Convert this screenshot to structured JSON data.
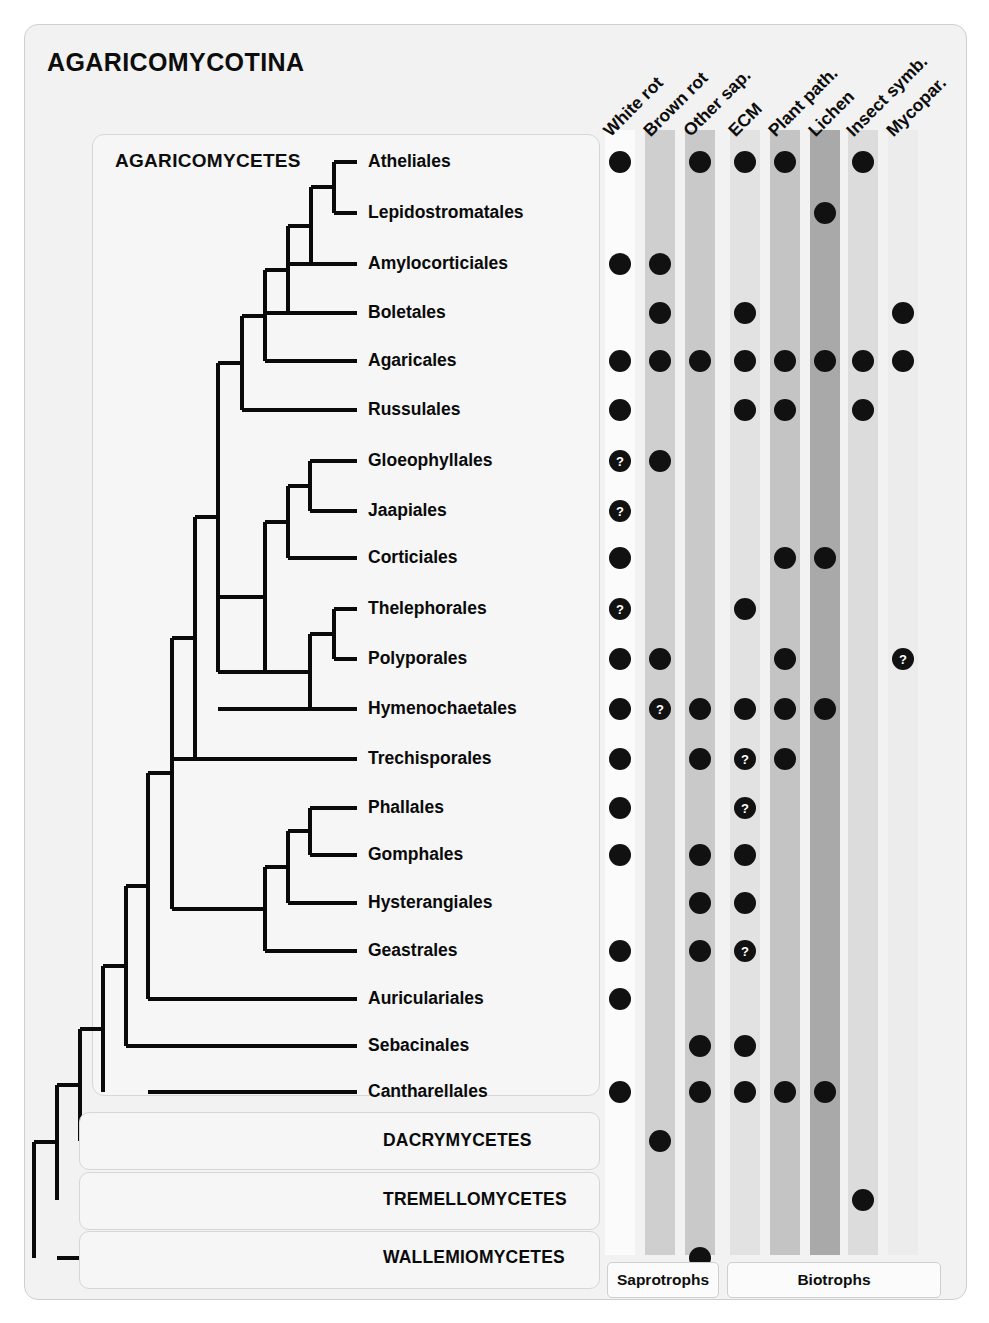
{
  "figure": {
    "title": "AGARICOMYCOTINA",
    "clade_title": "AGARICOMYCETES"
  },
  "columns": [
    {
      "key": "white_rot",
      "label": "White rot",
      "x": 620,
      "shade": "#fbfbfb",
      "group": "saprotrophs"
    },
    {
      "key": "brown_rot",
      "label": "Brown rot",
      "x": 660,
      "shade": "#cfcfcf",
      "group": "saprotrophs"
    },
    {
      "key": "other_sap",
      "label": "Other sap.",
      "x": 700,
      "shade": "#c9c9c9",
      "group": "saprotrophs"
    },
    {
      "key": "ecm",
      "label": "ECM",
      "x": 745,
      "shade": "#e2e2e2",
      "group": "biotrophs"
    },
    {
      "key": "plant_path",
      "label": "Plant path.",
      "x": 785,
      "shade": "#c4c4c4",
      "group": "biotrophs"
    },
    {
      "key": "lichen",
      "label": "Lichen",
      "x": 825,
      "shade": "#a9a9a9",
      "group": "biotrophs"
    },
    {
      "key": "insect_symb",
      "label": "Insect symb.",
      "x": 863,
      "shade": "#dcdcdc",
      "group": "biotrophs"
    },
    {
      "key": "mycopar",
      "label": "Mycopar.",
      "x": 903,
      "shade": "#ececec",
      "group": "biotrophs"
    }
  ],
  "groups": [
    {
      "key": "saprotrophs",
      "label": "Saprotrophs",
      "left": 607,
      "width": 110
    },
    {
      "key": "biotrophs",
      "label": "Biotrophs",
      "left": 727,
      "width": 212
    }
  ],
  "rows": [
    {
      "name": "Atheliales",
      "y": 162,
      "label_x": 368,
      "kind": "order",
      "cells": {
        "white_rot": "dot",
        "other_sap": "dot",
        "ecm": "dot",
        "plant_path": "dot",
        "insect_symb": "dot"
      }
    },
    {
      "name": "Lepidostromatales",
      "y": 213,
      "label_x": 368,
      "kind": "order",
      "cells": {
        "lichen": "dot"
      }
    },
    {
      "name": "Amylocorticiales",
      "y": 264,
      "label_x": 368,
      "kind": "order",
      "cells": {
        "white_rot": "dot",
        "brown_rot": "dot"
      }
    },
    {
      "name": "Boletales",
      "y": 313,
      "label_x": 368,
      "kind": "order",
      "cells": {
        "brown_rot": "dot",
        "ecm": "dot",
        "mycopar": "dot"
      }
    },
    {
      "name": "Agaricales",
      "y": 361,
      "label_x": 368,
      "kind": "order",
      "cells": {
        "white_rot": "dot",
        "brown_rot": "dot",
        "other_sap": "dot",
        "ecm": "dot",
        "plant_path": "dot",
        "lichen": "dot",
        "insect_symb": "dot",
        "mycopar": "dot"
      }
    },
    {
      "name": "Russulales",
      "y": 410,
      "label_x": 368,
      "kind": "order",
      "cells": {
        "white_rot": "dot",
        "ecm": "dot",
        "plant_path": "dot",
        "insect_symb": "dot"
      }
    },
    {
      "name": "Gloeophyllales",
      "y": 461,
      "label_x": 368,
      "kind": "order",
      "cells": {
        "white_rot": "q",
        "brown_rot": "dot"
      }
    },
    {
      "name": "Jaapiales",
      "y": 511,
      "label_x": 368,
      "kind": "order",
      "cells": {
        "white_rot": "q"
      }
    },
    {
      "name": "Corticiales",
      "y": 558,
      "label_x": 368,
      "kind": "order",
      "cells": {
        "white_rot": "dot",
        "plant_path": "dot",
        "lichen": "dot"
      }
    },
    {
      "name": "Thelephorales",
      "y": 609,
      "label_x": 368,
      "kind": "order",
      "cells": {
        "white_rot": "q",
        "ecm": "dot"
      }
    },
    {
      "name": "Polyporales",
      "y": 659,
      "label_x": 368,
      "kind": "order",
      "cells": {
        "white_rot": "dot",
        "brown_rot": "dot",
        "plant_path": "dot",
        "mycopar": "q"
      }
    },
    {
      "name": "Hymenochaetales",
      "y": 709,
      "label_x": 368,
      "kind": "order",
      "cells": {
        "white_rot": "dot",
        "brown_rot": "q",
        "other_sap": "dot",
        "ecm": "dot",
        "plant_path": "dot",
        "lichen": "dot"
      }
    },
    {
      "name": "Trechisporales",
      "y": 759,
      "label_x": 368,
      "kind": "order",
      "cells": {
        "white_rot": "dot",
        "other_sap": "dot",
        "ecm": "q",
        "plant_path": "dot"
      }
    },
    {
      "name": "Phallales",
      "y": 808,
      "label_x": 368,
      "kind": "order",
      "cells": {
        "white_rot": "dot",
        "ecm": "q"
      }
    },
    {
      "name": "Gomphales",
      "y": 855,
      "label_x": 368,
      "kind": "order",
      "cells": {
        "white_rot": "dot",
        "other_sap": "dot",
        "ecm": "dot"
      }
    },
    {
      "name": "Hysterangiales",
      "y": 903,
      "label_x": 368,
      "kind": "order",
      "cells": {
        "other_sap": "dot",
        "ecm": "dot"
      }
    },
    {
      "name": "Geastrales",
      "y": 951,
      "label_x": 368,
      "kind": "order",
      "cells": {
        "white_rot": "dot",
        "other_sap": "dot",
        "ecm": "q"
      }
    },
    {
      "name": "Auriculariales",
      "y": 999,
      "label_x": 368,
      "kind": "order",
      "cells": {
        "white_rot": "dot"
      }
    },
    {
      "name": "Sebacinales",
      "y": 1046,
      "label_x": 368,
      "kind": "order",
      "cells": {
        "other_sap": "dot",
        "ecm": "dot"
      }
    },
    {
      "name": "Cantharellales",
      "y": 1092,
      "label_x": 368,
      "kind": "order",
      "cells": {
        "white_rot": "dot",
        "other_sap": "dot",
        "ecm": "dot",
        "plant_path": "dot",
        "lichen": "dot"
      }
    },
    {
      "name": "DACRYMYCETES",
      "y": 1141,
      "label_x": 383,
      "kind": "class",
      "box_top": 1112,
      "cells": {
        "brown_rot": "dot"
      }
    },
    {
      "name": "TREMELLOMYCETES",
      "y": 1200,
      "label_x": 383,
      "kind": "class",
      "box_top": 1172,
      "cells": {
        "insect_symb": "dot"
      }
    },
    {
      "name": "WALLEMIOMYCETES",
      "y": 1258,
      "label_x": 383,
      "kind": "class",
      "box_top": 1231,
      "cells": {
        "other_sap": "dot"
      }
    }
  ],
  "chart_data": {
    "type": "table",
    "title": "AGARICOMYCOTINA",
    "legend": {
      "dot": "trait present",
      "q": "trait uncertain / questionable"
    },
    "column_groups": [
      "Saprotrophs",
      "Biotrophs"
    ],
    "columns": [
      "White rot",
      "Brown rot",
      "Other sap.",
      "ECM",
      "Plant path.",
      "Lichen",
      "Insect symb.",
      "Mycopar."
    ],
    "rows": [
      {
        "taxon": "Atheliales",
        "values": [
          "dot",
          "",
          "dot",
          "dot",
          "dot",
          "",
          "dot",
          ""
        ]
      },
      {
        "taxon": "Lepidostromatales",
        "values": [
          "",
          "",
          "",
          "",
          "",
          "dot",
          "",
          ""
        ]
      },
      {
        "taxon": "Amylocorticiales",
        "values": [
          "dot",
          "dot",
          "",
          "",
          "",
          "",
          "",
          ""
        ]
      },
      {
        "taxon": "Boletales",
        "values": [
          "",
          "dot",
          "",
          "dot",
          "",
          "",
          "",
          "dot"
        ]
      },
      {
        "taxon": "Agaricales",
        "values": [
          "dot",
          "dot",
          "dot",
          "dot",
          "dot",
          "dot",
          "dot",
          "dot"
        ]
      },
      {
        "taxon": "Russulales",
        "values": [
          "dot",
          "",
          "",
          "dot",
          "dot",
          "",
          "dot",
          ""
        ]
      },
      {
        "taxon": "Gloeophyllales",
        "values": [
          "q",
          "dot",
          "",
          "",
          "",
          "",
          "",
          ""
        ]
      },
      {
        "taxon": "Jaapiales",
        "values": [
          "q",
          "",
          "",
          "",
          "",
          "",
          "",
          ""
        ]
      },
      {
        "taxon": "Corticiales",
        "values": [
          "dot",
          "",
          "",
          "",
          "dot",
          "dot",
          "",
          ""
        ]
      },
      {
        "taxon": "Thelephorales",
        "values": [
          "q",
          "",
          "",
          "dot",
          "",
          "",
          "",
          ""
        ]
      },
      {
        "taxon": "Polyporales",
        "values": [
          "dot",
          "dot",
          "",
          "",
          "dot",
          "",
          "",
          "q"
        ]
      },
      {
        "taxon": "Hymenochaetales",
        "values": [
          "dot",
          "q",
          "dot",
          "dot",
          "dot",
          "dot",
          "",
          ""
        ]
      },
      {
        "taxon": "Trechisporales",
        "values": [
          "dot",
          "",
          "dot",
          "q",
          "dot",
          "",
          "",
          ""
        ]
      },
      {
        "taxon": "Phallales",
        "values": [
          "dot",
          "",
          "",
          "q",
          "",
          "",
          "",
          ""
        ]
      },
      {
        "taxon": "Gomphales",
        "values": [
          "dot",
          "",
          "dot",
          "dot",
          "",
          "",
          "",
          ""
        ]
      },
      {
        "taxon": "Hysterangiales",
        "values": [
          "",
          "",
          "dot",
          "dot",
          "",
          "",
          "",
          ""
        ]
      },
      {
        "taxon": "Geastrales",
        "values": [
          "dot",
          "",
          "dot",
          "q",
          "",
          "",
          "",
          ""
        ]
      },
      {
        "taxon": "Auriculariales",
        "values": [
          "dot",
          "",
          "",
          "",
          "",
          "",
          "",
          ""
        ]
      },
      {
        "taxon": "Sebacinales",
        "values": [
          "",
          "",
          "dot",
          "dot",
          "",
          "",
          "",
          ""
        ]
      },
      {
        "taxon": "Cantharellales",
        "values": [
          "dot",
          "",
          "dot",
          "dot",
          "dot",
          "dot",
          "",
          ""
        ]
      },
      {
        "taxon": "DACRYMYCETES",
        "values": [
          "",
          "dot",
          "",
          "",
          "",
          "",
          "",
          ""
        ]
      },
      {
        "taxon": "TREMELLOMYCETES",
        "values": [
          "",
          "",
          "",
          "",
          "",
          "",
          "dot",
          ""
        ]
      },
      {
        "taxon": "WALLEMIOMYCETES",
        "values": [
          "",
          "",
          "dot",
          "",
          "",
          "",
          "",
          ""
        ]
      }
    ]
  }
}
